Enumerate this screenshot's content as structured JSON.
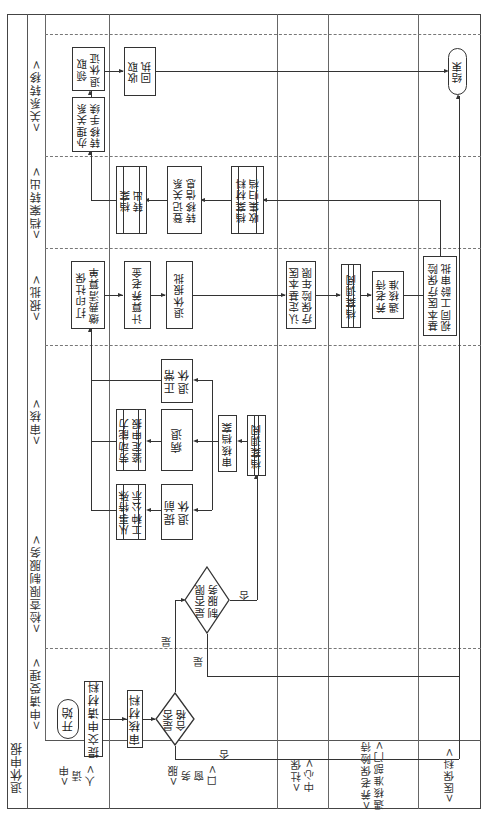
{
  "diagram": {
    "title": "退休申报",
    "orientation": "rotated-90-ccw",
    "lanes": [
      {
        "id": "applicant",
        "label": "<申\n请\n人>"
      },
      {
        "id": "service_window",
        "label": "<服\n务\n窗\n口>"
      },
      {
        "id": "social_security_center",
        "label": "<社保\n中心>"
      },
      {
        "id": "pension_approval_dept",
        "label": "<养老保险待\n遇核准部门>"
      },
      {
        "id": "medical_insurance",
        "label": "<医保科>"
      }
    ],
    "phases": [
      {
        "id": "accept",
        "label": "<申请受理>"
      },
      {
        "id": "check",
        "label": "<检查限制服务>"
      },
      {
        "id": "review",
        "label": "<审核>"
      },
      {
        "id": "approve",
        "label": "<报批>"
      },
      {
        "id": "transfer_out",
        "label": "<档案转出>"
      },
      {
        "id": "relation_transfer",
        "label": "<关系转移>"
      }
    ],
    "nodes": {
      "start": "开始",
      "submit": "提交申请材料",
      "review_materials": "审核材料",
      "qualified": "是否\n合格",
      "restricted": "是否限\n制服务",
      "archive_lookup_1": "档案调阅",
      "review_archive": "审核档案",
      "early_retire": "提前\n退休",
      "sick_retire": "病退",
      "normal_retire": "正常\n退休",
      "special_work_notice": "从事特殊\n工种公示",
      "labor_ability": "劳动能力\n鉴定申报",
      "print_statement": "打印社保\n缴费清算单",
      "calc_pension": "计算养老金",
      "retire_submit": "退休报批",
      "confirm_medical_years": "认定基本医\n疗保险年限",
      "archive_lookup_2": "档案调阅",
      "pension_approval": "养老待\n遇核准",
      "medical_age_approval": "基本医疗保险\n视同工龄审批",
      "archive_collect": "档案材料\n收集归档",
      "register_transfer": "登记关系\n转移信息",
      "archive_out": "档案\n转出",
      "handle_transfer": "办理关系\n转移手续",
      "get_certificate": "领取\n退休证",
      "receive_receipt": "收取\n回执",
      "end": "结束"
    },
    "edge_labels": {
      "qualified_yes": "是",
      "qualified_no": "否",
      "restricted_yes": "是",
      "restricted_no": "否"
    }
  }
}
